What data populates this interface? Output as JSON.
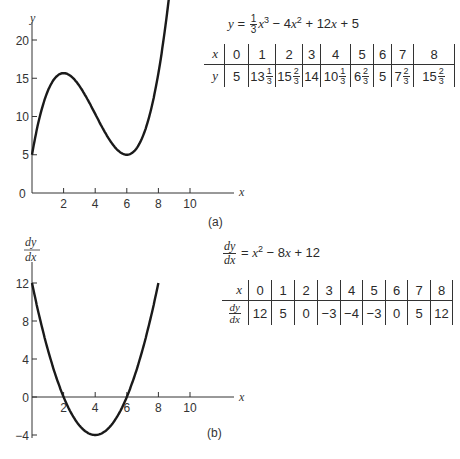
{
  "chart_data": [
    {
      "type": "line",
      "panel_label": "(a)",
      "title": "y = 1/3 x^3 - 4x^2 + 12x + 5",
      "xlabel": "x",
      "ylabel": "y",
      "xlim": [
        0,
        12
      ],
      "ylim": [
        0,
        22
      ],
      "x_ticks": [
        2,
        4,
        6,
        8,
        10
      ],
      "y_ticks": [
        0,
        5,
        10,
        15,
        20
      ],
      "grid": false,
      "curve": {
        "x_start": 0,
        "x_end": 9
      },
      "x": [
        0,
        1,
        2,
        3,
        4,
        5,
        6,
        7,
        8,
        9
      ],
      "values": [
        5,
        13.333,
        15.667,
        14,
        10.333,
        6.667,
        5,
        7.667,
        15.667,
        23
      ]
    },
    {
      "type": "line",
      "panel_label": "(b)",
      "title": "dy/dx = x^2 - 8x + 12",
      "xlabel": "x",
      "ylabel": "dy/dx",
      "xlim": [
        0,
        12
      ],
      "ylim": [
        -4,
        14
      ],
      "x_ticks": [
        2,
        4,
        6,
        8,
        10
      ],
      "y_ticks": [
        -4,
        0,
        4,
        8,
        12
      ],
      "grid": false,
      "curve": {
        "x_start": 0,
        "x_end": 8
      },
      "x": [
        0,
        1,
        2,
        3,
        4,
        5,
        6,
        7,
        8
      ],
      "values": [
        12,
        5,
        0,
        -3,
        -4,
        -3,
        0,
        5,
        12
      ]
    }
  ],
  "panel_a": {
    "caption": "(a)",
    "y_axis_label": "y",
    "x_axis_label": "x",
    "origin_label": "0",
    "y_tick_labels": [
      "20",
      "15",
      "10",
      "5"
    ],
    "x_tick_labels": [
      "2",
      "4",
      "6",
      "8",
      "10"
    ],
    "equation": {
      "lhs": "y",
      "equals": "=",
      "frac_num": "1",
      "frac_den": "3",
      "term1": "x",
      "exp1": "3",
      "term2": " − 4",
      "var2": "x",
      "exp2": "2",
      "term3": " + 12",
      "var3": "x",
      "term4": " + 5"
    },
    "table": {
      "row1_header": "x",
      "row2_header": "y",
      "x_values": [
        "0",
        "1",
        "2",
        "3",
        "4",
        "5",
        "6",
        "7",
        "8"
      ],
      "y_values": [
        {
          "whole": "5",
          "num": "",
          "den": ""
        },
        {
          "whole": "13",
          "num": "1",
          "den": "3"
        },
        {
          "whole": "15",
          "num": "2",
          "den": "3"
        },
        {
          "whole": "14",
          "num": "",
          "den": ""
        },
        {
          "whole": "10",
          "num": "1",
          "den": "3"
        },
        {
          "whole": "6",
          "num": "2",
          "den": "3"
        },
        {
          "whole": "5",
          "num": "",
          "den": ""
        },
        {
          "whole": "7",
          "num": "2",
          "den": "3"
        },
        {
          "whole": "15",
          "num": "2",
          "den": "3"
        }
      ]
    }
  },
  "panel_b": {
    "caption": "(b)",
    "y_axis_label_num": "dy",
    "y_axis_label_den": "dx",
    "x_axis_label": "x",
    "y_tick_labels": [
      "12",
      "8",
      "4",
      "0",
      "−4"
    ],
    "x_tick_labels": [
      "2",
      "4",
      "6",
      "8",
      "10"
    ],
    "equation": {
      "lhs_num": "dy",
      "lhs_den": "dx",
      "equals": "=",
      "var1": "x",
      "exp1": "2",
      "term2": " − 8",
      "var2": "x",
      "term3": " + 12"
    },
    "table": {
      "row1_header": "x",
      "row2_header_num": "dy",
      "row2_header_den": "dx",
      "x_values": [
        "0",
        "1",
        "2",
        "3",
        "4",
        "5",
        "6",
        "7",
        "8"
      ],
      "dydx_values": [
        "12",
        "5",
        "0",
        "−3",
        "−4",
        "−3",
        "0",
        "5",
        "12"
      ]
    }
  }
}
